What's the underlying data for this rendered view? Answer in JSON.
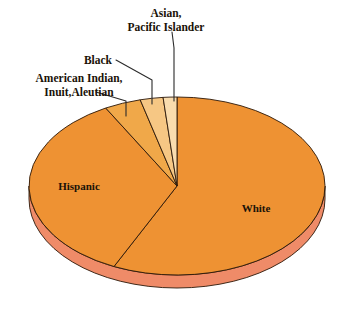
{
  "chart_data": {
    "type": "pie",
    "title": "",
    "subtitle": "",
    "xlabel": "",
    "ylabel": "",
    "legend_position": "none",
    "grid": false,
    "three_d": true,
    "categories": [
      "White",
      "Hispanic",
      "American Indian, Inuit,Aleutian",
      "Black",
      "Asian, Pacific Islander"
    ],
    "values": [
      57.0,
      35.0,
      4.0,
      2.5,
      1.5
    ],
    "units": "percent",
    "slices": [
      {
        "label": "White",
        "value": 57.0,
        "color": "#ee9233",
        "label_placement": "inside",
        "label_x": 256,
        "label_y": 212,
        "start_angle_deg": 0,
        "end_angle_deg": 205.2
      },
      {
        "label": "Hispanic",
        "value": 35.0,
        "color": "#ee9233",
        "label_placement": "inside",
        "label_x": 79,
        "label_y": 188,
        "start_angle_deg": 205.2,
        "end_angle_deg": 331.2
      },
      {
        "label": "American Indian, Inuit,Aleutian",
        "value": 4.0,
        "color": "#f0a849",
        "label_placement": "outside",
        "leader": true,
        "start_angle_deg": 331.2,
        "end_angle_deg": 345.6
      },
      {
        "label": "Black",
        "value": 2.5,
        "color": "#f6c784",
        "label_placement": "outside",
        "leader": true,
        "start_angle_deg": 345.6,
        "end_angle_deg": 354.6
      },
      {
        "label": "Asian, Pacific Islander",
        "value": 1.5,
        "color": "#f9dcae",
        "label_placement": "outside",
        "leader": true,
        "start_angle_deg": 354.6,
        "end_angle_deg": 360
      }
    ],
    "colors": {
      "white_slice": "#ee9233",
      "hispanic_slice": "#ee9233",
      "american_indian_slice": "#f0a849",
      "black_slice": "#f6c784",
      "asian_slice": "#f9dcae",
      "side_wall": "#ef8b68",
      "outline": "#2b1708",
      "background": "#ffffff",
      "label_text": "#1a1208",
      "leader_line": "#2b2b2b"
    },
    "labels": {
      "white": "White",
      "hispanic": "Hispanic",
      "american_indian_line1": "American Indian,",
      "american_indian_line2": "Inuit,Aleutian",
      "black": "Black",
      "asian_line1": "Asian,",
      "asian_line2": "Pacific Islander"
    }
  }
}
